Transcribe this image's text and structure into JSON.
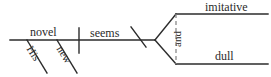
{
  "diagram": {
    "kind": "reed-kellogg-sentence-diagram",
    "sentence": "His new novel seems imitative and dull.",
    "ink_color": "#2b2b2b",
    "background_color": "#ffffff",
    "nodes": {
      "subject": "novel",
      "verb": "seems",
      "modifier_1": "His",
      "modifier_2": "new",
      "complement_1": "imitative",
      "complement_2": "dull",
      "conjunction": "and"
    },
    "lines": {
      "baseline": {
        "x1": 10,
        "y1": 40,
        "x2": 155,
        "y2": 40
      },
      "subject_verb_divider": {
        "x1": 79,
        "y1": 28,
        "x2": 79,
        "y2": 53
      },
      "complement_slant": {
        "x1": 131,
        "y1": 27,
        "x2": 146,
        "y2": 47
      },
      "fork_upper": {
        "x1": 155,
        "y1": 40,
        "x2": 176,
        "y2": 14
      },
      "fork_lower": {
        "x1": 155,
        "y1": 40,
        "x2": 176,
        "y2": 64
      },
      "complement_rule_1": {
        "x1": 176,
        "y1": 14,
        "x2": 268,
        "y2": 14
      },
      "complement_rule_2": {
        "x1": 176,
        "y1": 64,
        "x2": 268,
        "y2": 64
      },
      "conjunction_connector": {
        "x1": 176,
        "y1": 14,
        "x2": 176,
        "y2": 64,
        "style": "dashed"
      },
      "modifier_slant_1": {
        "x1": 27,
        "y1": 40,
        "x2": 47,
        "y2": 73
      },
      "modifier_slant_2": {
        "x1": 57,
        "y1": 40,
        "x2": 77,
        "y2": 73
      }
    }
  }
}
